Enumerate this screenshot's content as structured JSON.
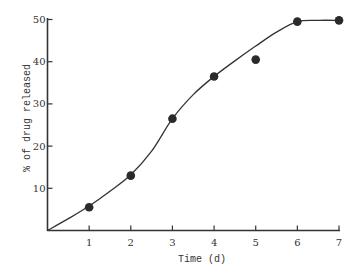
{
  "chart_data": {
    "type": "scatter",
    "title": "",
    "xlabel": "Time (d)",
    "ylabel": "% of drug released",
    "xlim": [
      0,
      7
    ],
    "ylim": [
      0,
      50
    ],
    "grid": false,
    "legend": null,
    "x_ticks": [
      1,
      2,
      3,
      4,
      5,
      6,
      7
    ],
    "y_ticks": [
      10,
      20,
      30,
      40,
      50
    ],
    "series": [
      {
        "name": "observed",
        "marker": "filled-circle",
        "x": [
          1,
          2,
          3,
          4,
          5,
          6,
          7
        ],
        "y": [
          5.5,
          13,
          26.5,
          36.5,
          40.5,
          49.5,
          49.8
        ]
      },
      {
        "name": "fitted-curve",
        "style": "line",
        "x": [
          0,
          0.5,
          1,
          1.5,
          2,
          2.5,
          3,
          3.5,
          4,
          4.5,
          5,
          5.5,
          6,
          6.5,
          7
        ],
        "y": [
          0,
          2.8,
          5.8,
          9.3,
          13.2,
          18.8,
          26.5,
          32.2,
          36.5,
          40.2,
          43.7,
          47,
          49.5,
          49.8,
          49.8
        ]
      }
    ]
  },
  "axes": {
    "x_title": "Time (d)",
    "y_title": "% of drug released"
  },
  "colors": {
    "ink": "#333333",
    "background": "#ffffff"
  }
}
